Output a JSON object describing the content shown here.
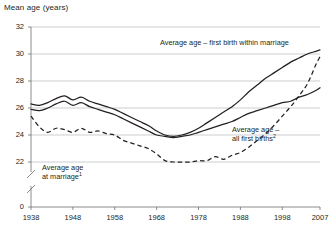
{
  "chart_data": {
    "type": "line",
    "title": "Mean age (years)",
    "xlabel": "",
    "ylabel": "Mean age (years)",
    "xlim": [
      1938,
      2007
    ],
    "ylim": [
      21.4,
      32
    ],
    "grid": true,
    "legend_position": "inline-annotations",
    "y_axis_break": true,
    "y_ticks": [
      "32",
      "30",
      "28",
      "26",
      "24",
      "22",
      "0"
    ],
    "y_tick_values": [
      32,
      30,
      28,
      26,
      24,
      22,
      0
    ],
    "x_ticks": [
      "1938",
      "1948",
      "1958",
      "1968",
      "1978",
      "1988",
      "1998",
      "2007"
    ],
    "x_tick_values": [
      1938,
      1948,
      1958,
      1968,
      1978,
      1988,
      1998,
      2007
    ],
    "annotations": [
      {
        "name": "first-birth-within-marriage",
        "text": "Average age – first birth within marriage",
        "style": "solid"
      },
      {
        "name": "all-first-births",
        "text": "Average age –",
        "text_line2": "all first births",
        "superscript": "2",
        "style": "solid"
      },
      {
        "name": "age-at-marriage",
        "text": "Average age",
        "text_line2": "at marriage",
        "superscript": "1",
        "style": "dashed"
      }
    ],
    "series": [
      {
        "name": "Average age – first birth within marriage",
        "style": "solid",
        "x": [
          1938,
          1940,
          1942,
          1944,
          1946,
          1948,
          1950,
          1952,
          1954,
          1956,
          1958,
          1960,
          1962,
          1964,
          1966,
          1968,
          1970,
          1972,
          1974,
          1976,
          1978,
          1980,
          1982,
          1984,
          1986,
          1988,
          1990,
          1992,
          1994,
          1996,
          1998,
          2000,
          2002,
          2004,
          2006,
          2007
        ],
        "values": [
          26.3,
          26.2,
          26.4,
          26.7,
          26.9,
          26.6,
          26.8,
          26.5,
          26.3,
          26.1,
          25.9,
          25.6,
          25.3,
          25.0,
          24.7,
          24.3,
          24.0,
          23.9,
          24.0,
          24.2,
          24.5,
          24.9,
          25.3,
          25.7,
          26.1,
          26.6,
          27.2,
          27.7,
          28.2,
          28.6,
          29.0,
          29.4,
          29.7,
          30.0,
          30.2,
          30.3
        ]
      },
      {
        "name": "Average age – all first births",
        "style": "solid",
        "x": [
          1938,
          1940,
          1942,
          1944,
          1946,
          1948,
          1950,
          1952,
          1954,
          1956,
          1958,
          1960,
          1962,
          1964,
          1966,
          1968,
          1970,
          1972,
          1974,
          1976,
          1978,
          1980,
          1982,
          1984,
          1986,
          1988,
          1990,
          1992,
          1994,
          1996,
          1998,
          2000,
          2002,
          2004,
          2006,
          2007
        ],
        "values": [
          25.9,
          25.8,
          26.0,
          26.3,
          26.5,
          26.2,
          26.4,
          26.1,
          25.9,
          25.7,
          25.5,
          25.2,
          24.9,
          24.6,
          24.3,
          24.0,
          23.9,
          23.8,
          23.9,
          24.0,
          24.2,
          24.4,
          24.6,
          24.8,
          25.0,
          25.3,
          25.6,
          25.8,
          26.0,
          26.2,
          26.4,
          26.5,
          26.8,
          27.0,
          27.3,
          27.5
        ]
      },
      {
        "name": "Average age at marriage",
        "style": "dashed",
        "x": [
          1938,
          1940,
          1942,
          1944,
          1946,
          1948,
          1950,
          1952,
          1954,
          1956,
          1958,
          1960,
          1962,
          1964,
          1966,
          1968,
          1970,
          1972,
          1974,
          1976,
          1978,
          1980,
          1982,
          1984,
          1986,
          1988,
          1990,
          1992,
          1994,
          1996,
          1998,
          2000,
          2002,
          2004,
          2006,
          2007
        ],
        "values": [
          25.4,
          24.6,
          24.2,
          24.5,
          24.4,
          24.2,
          24.5,
          24.2,
          24.3,
          24.1,
          24.0,
          23.6,
          23.4,
          23.2,
          23.0,
          22.6,
          22.1,
          22.0,
          22.0,
          22.0,
          22.1,
          22.1,
          22.4,
          22.2,
          22.5,
          22.7,
          23.1,
          23.6,
          24.1,
          24.7,
          25.4,
          26.1,
          26.9,
          27.8,
          29.2,
          29.8
        ]
      }
    ]
  }
}
